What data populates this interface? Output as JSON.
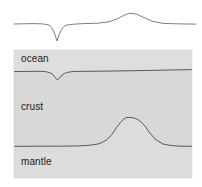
{
  "figure": {
    "name": "gravity-anomaly-crustal-cross-section",
    "background_color": "#ffffff",
    "width": 202,
    "height": 187
  },
  "profile_curve": {
    "name": "gravity-anomaly-profile",
    "stroke_color": "#6f6f6f",
    "stroke_width": 0.9,
    "baseline_y": 24,
    "trench_min": {
      "x": 57,
      "y": 41
    },
    "ridge_max": {
      "x": 131,
      "y": 13
    },
    "path": "M 14 24 L 33 23.6 Q 44 23.4 49 25 Q 53 27 57 41 Q 61 27 66 25.2 Q 72 24 84 23.6 L 98 23.2 Q 110 22.6 118 18.6 Q 126 13.6 131 13.2 Q 137 13.4 144 17.6 Q 152 22.2 163 23.4 L 180 23.9 L 196 24.1"
  },
  "block": {
    "name": "cross-section-block",
    "x": 14,
    "y": 50,
    "width": 178,
    "height": 128,
    "ocean_fill": "#dededd",
    "crust_fill": "#d8d8d7",
    "mantle_fill": "#dcdcdb",
    "border_color": "#d0d0cf"
  },
  "seafloor_boundary": {
    "name": "ocean-crust-boundary",
    "stroke_color": "#4a4a4a",
    "stroke_width": 0.9,
    "baseline_y": 71,
    "trench_min": {
      "x": 57,
      "y": 80
    },
    "path": "M 14 71.5 L 40 71.3 Q 49 71.2 53 74.5 Q 56 78.6 57.5 80 Q 59 78.6 62 75 Q 66 71.6 76 71.4 L 100 71.2 Q 130 70.8 160 70.2 L 192 69.6"
  },
  "moho_boundary": {
    "name": "crust-mantle-boundary",
    "stroke_color": "#4a4a4a",
    "stroke_width": 0.9,
    "baseline_y": 146,
    "ridge_max": {
      "x": 131,
      "y": 117
    },
    "path": "M 14 146.3 L 70 146.1 Q 88 146 98 144 Q 107 141.6 113 133 Q 121 120 126 117.6 Q 131 116.6 136 118.6 Q 143 122 149 132 Q 155 141 163 144 Q 171 146 180 146.2 L 192 146.3"
  },
  "labels": {
    "ocean": "ocean",
    "crust": "crust",
    "mantle": "mantle"
  }
}
